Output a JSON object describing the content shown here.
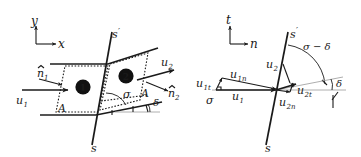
{
  "figure": {
    "width": 361,
    "height": 157,
    "background": "#ffffff",
    "ink": "#1a1a1a",
    "hairline": "#999999"
  },
  "left_panel": {
    "name": "control-volume-panel",
    "axes": {
      "vertical_label": "y",
      "horizontal_label": "x"
    },
    "shock_line": {
      "upper_label": "s",
      "upper_label_prime": "′",
      "lower_label": "s"
    },
    "regions": [
      {
        "marker": "❶",
        "number": "1"
      },
      {
        "marker": "❷",
        "number": "2"
      }
    ],
    "vectors": [
      {
        "label": "u",
        "sub": "1",
        "kind": "velocity-upstream"
      },
      {
        "label": "u",
        "sub": "2",
        "kind": "velocity-downstream"
      },
      {
        "label": "n",
        "sub": "1",
        "kind": "unit-normal-upstream",
        "hat": true
      },
      {
        "label": "n",
        "sub": "2",
        "kind": "unit-normal-downstream",
        "hat": true
      }
    ],
    "areas": [
      {
        "label": "A",
        "side": "left"
      },
      {
        "label": "A",
        "side": "right"
      }
    ],
    "angles": [
      {
        "label": "σ",
        "name": "shock-angle"
      },
      {
        "label": "δ",
        "name": "deflection-angle"
      }
    ]
  },
  "right_panel": {
    "name": "velocity-components-panel",
    "axes": {
      "vertical_label": "t",
      "horizontal_label": "n"
    },
    "shock_line": {
      "upper_label": "s",
      "upper_label_prime": "′",
      "lower_label": "s"
    },
    "angles": [
      {
        "label": "σ",
        "name": "shock-angle"
      },
      {
        "label": "δ",
        "name": "deflection-angle"
      },
      {
        "label": "σ − δ",
        "name": "shock-minus-deflection-angle"
      }
    ],
    "vectors": [
      {
        "label": "u",
        "sub": "1",
        "kind": "velocity-upstream"
      },
      {
        "label": "u",
        "sub": "1t",
        "kind": "tangential-upstream"
      },
      {
        "label": "u",
        "sub": "1n",
        "kind": "normal-upstream"
      },
      {
        "label": "u",
        "sub": "2",
        "kind": "velocity-downstream"
      },
      {
        "label": "u",
        "sub": "2t",
        "kind": "tangential-downstream"
      },
      {
        "label": "u",
        "sub": "2n",
        "kind": "normal-downstream"
      }
    ]
  }
}
